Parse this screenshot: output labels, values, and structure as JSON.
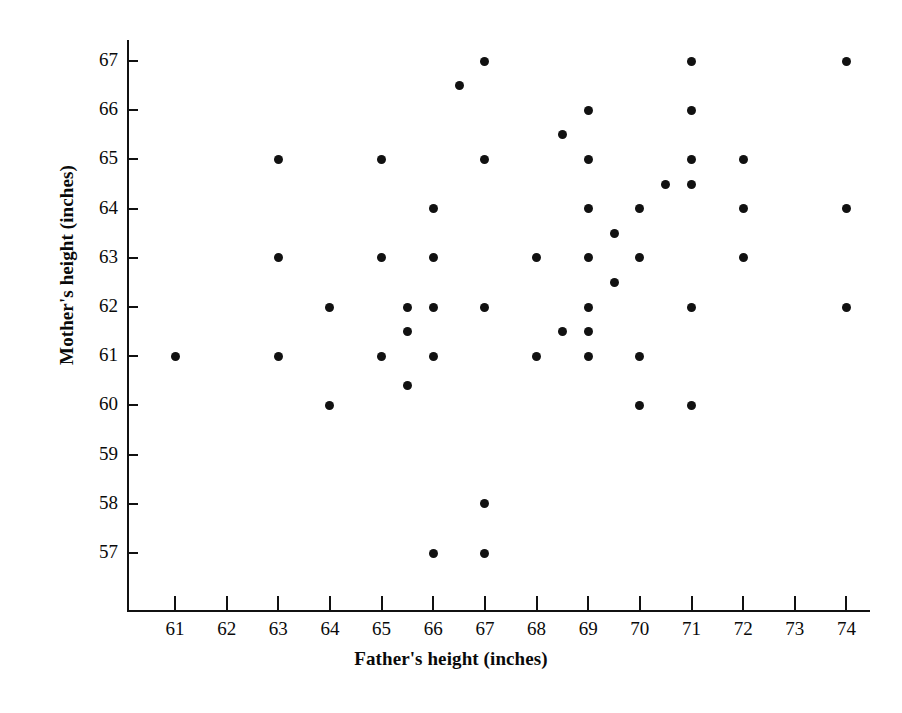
{
  "chart_data": {
    "type": "scatter",
    "title": "",
    "xlabel": "Father's height (inches)",
    "ylabel": "Mother's height (inches)",
    "xlim": [
      60.3,
      74.7
    ],
    "ylim": [
      56.0,
      67.6
    ],
    "xticks": [
      61,
      62,
      63,
      64,
      65,
      66,
      67,
      68,
      69,
      70,
      71,
      72,
      73,
      74
    ],
    "yticks": [
      57,
      58,
      59,
      60,
      61,
      62,
      63,
      64,
      65,
      66,
      67
    ],
    "grid": false,
    "legend": false,
    "marker": "filled-circle",
    "marker_color": "#111111",
    "points": [
      {
        "x": 61,
        "y": 61
      },
      {
        "x": 63,
        "y": 65
      },
      {
        "x": 63,
        "y": 63
      },
      {
        "x": 63,
        "y": 61
      },
      {
        "x": 64,
        "y": 62
      },
      {
        "x": 64,
        "y": 60
      },
      {
        "x": 65,
        "y": 65
      },
      {
        "x": 65,
        "y": 63
      },
      {
        "x": 65,
        "y": 61
      },
      {
        "x": 65.5,
        "y": 62
      },
      {
        "x": 65.5,
        "y": 61.5
      },
      {
        "x": 65.5,
        "y": 60.4
      },
      {
        "x": 66,
        "y": 64
      },
      {
        "x": 66,
        "y": 63
      },
      {
        "x": 66,
        "y": 62
      },
      {
        "x": 66,
        "y": 61
      },
      {
        "x": 66,
        "y": 57
      },
      {
        "x": 66.5,
        "y": 66.5
      },
      {
        "x": 67,
        "y": 67
      },
      {
        "x": 67,
        "y": 65
      },
      {
        "x": 67,
        "y": 62
      },
      {
        "x": 67,
        "y": 58
      },
      {
        "x": 67,
        "y": 57
      },
      {
        "x": 68,
        "y": 63
      },
      {
        "x": 68,
        "y": 61
      },
      {
        "x": 68.5,
        "y": 65.5
      },
      {
        "x": 68.5,
        "y": 61.5
      },
      {
        "x": 69,
        "y": 66
      },
      {
        "x": 69,
        "y": 65
      },
      {
        "x": 69,
        "y": 64
      },
      {
        "x": 69,
        "y": 63
      },
      {
        "x": 69,
        "y": 62
      },
      {
        "x": 69,
        "y": 61.5
      },
      {
        "x": 69,
        "y": 61
      },
      {
        "x": 69.5,
        "y": 63.5
      },
      {
        "x": 69.5,
        "y": 62.5
      },
      {
        "x": 70,
        "y": 64
      },
      {
        "x": 70,
        "y": 63
      },
      {
        "x": 70,
        "y": 61
      },
      {
        "x": 70,
        "y": 60
      },
      {
        "x": 70.5,
        "y": 64.5
      },
      {
        "x": 71,
        "y": 67
      },
      {
        "x": 71,
        "y": 66
      },
      {
        "x": 71,
        "y": 65
      },
      {
        "x": 71,
        "y": 64.5
      },
      {
        "x": 71,
        "y": 62
      },
      {
        "x": 71,
        "y": 60
      },
      {
        "x": 72,
        "y": 65
      },
      {
        "x": 72,
        "y": 64
      },
      {
        "x": 72,
        "y": 63
      },
      {
        "x": 74,
        "y": 67
      },
      {
        "x": 74,
        "y": 64
      },
      {
        "x": 74,
        "y": 62
      }
    ]
  }
}
